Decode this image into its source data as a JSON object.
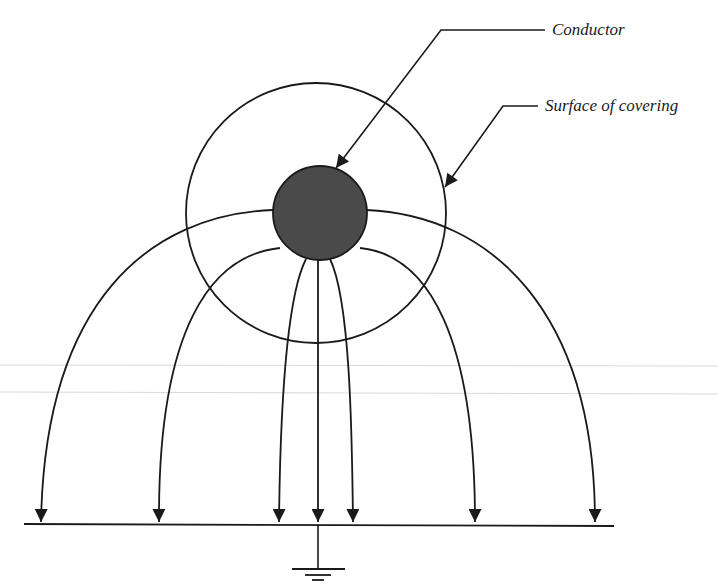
{
  "figure": {
    "labels": {
      "conductor": "Conductor",
      "surface": "Surface of covering"
    },
    "colors": {
      "line": "#1a1a1a",
      "conductor_fill": "#4a4a4a",
      "background": "#ffffff"
    },
    "elements": {
      "conductor_circle": {
        "cx": 320,
        "cy": 213,
        "r": 47
      },
      "covering_circle": {
        "cx": 316,
        "cy": 213,
        "r": 130
      },
      "ground_line": {
        "x1": 24,
        "y1": 524,
        "x2": 614,
        "y2": 526
      },
      "ground_symbol": {
        "x": 318,
        "top": 525,
        "bottom": 568
      },
      "field_lines_count": 7,
      "field_line_arrow_tips_x": [
        40,
        159,
        279,
        318,
        353,
        475,
        595
      ]
    }
  }
}
